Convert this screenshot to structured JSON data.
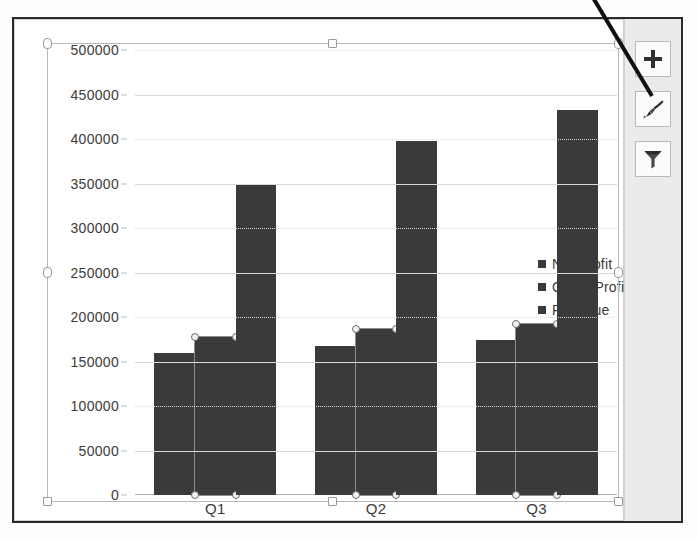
{
  "chart_data": {
    "type": "bar",
    "title": "",
    "xlabel": "",
    "ylabel": "",
    "ylim": [
      0,
      500000
    ],
    "ystep": 50000,
    "grid": true,
    "legend_position": "right",
    "categories": [
      "Q1",
      "Q2",
      "Q3"
    ],
    "series": [
      {
        "name": "Net Profit",
        "values": [
          160000,
          167000,
          174000
        ],
        "color": "#3a3a3a",
        "selected": false
      },
      {
        "name": "Gross Profit",
        "values": [
          178000,
          186000,
          192000
        ],
        "color": "#3a3a3a",
        "selected": true
      },
      {
        "name": "Revenue",
        "values": [
          350000,
          398000,
          433000
        ],
        "color": "#3a3a3a",
        "selected": false
      }
    ],
    "y_ticks": [
      {
        "label": "500000",
        "value": 500000
      },
      {
        "label": "450000",
        "value": 450000
      },
      {
        "label": "400000",
        "value": 400000
      },
      {
        "label": "350000",
        "value": 350000
      },
      {
        "label": "300000",
        "value": 300000
      },
      {
        "label": "250000",
        "value": 250000
      },
      {
        "label": "200000",
        "value": 200000
      },
      {
        "label": "150000",
        "value": 150000
      },
      {
        "label": "100000",
        "value": 100000
      },
      {
        "label": "50000",
        "value": 50000
      },
      {
        "label": "0",
        "value": 0
      }
    ]
  },
  "legend": {
    "items": [
      {
        "label": "Net Profit"
      },
      {
        "label": "Gross Profit"
      },
      {
        "label": "Revenue"
      }
    ]
  },
  "side_buttons": [
    {
      "name": "chart-elements-button",
      "icon": "plus-icon"
    },
    {
      "name": "chart-styles-button",
      "icon": "paintbrush-icon"
    },
    {
      "name": "chart-filters-button",
      "icon": "funnel-icon"
    }
  ],
  "annotation": {
    "type": "callout-line",
    "points_to": "chart-styles-button"
  }
}
